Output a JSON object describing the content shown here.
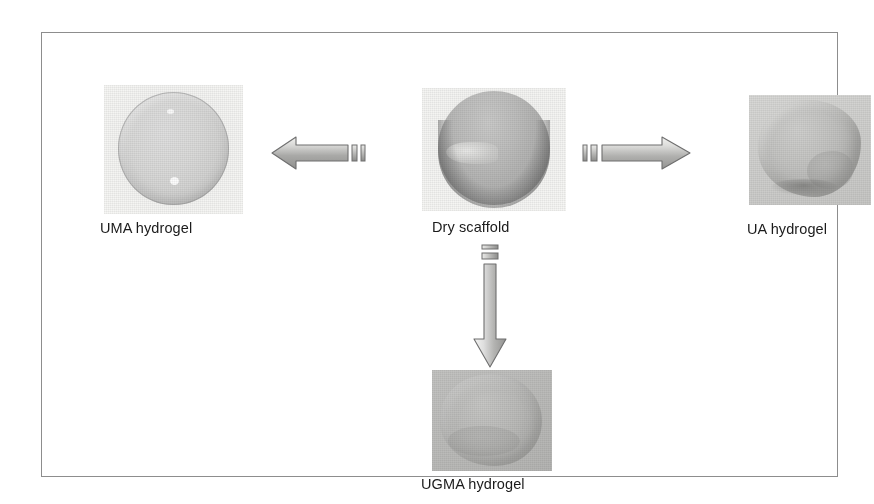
{
  "figure": {
    "frame_color": "#8d8d8d",
    "background": "#ffffff",
    "caption_color": "#1b1b1b",
    "arrow_outline_color": "#6e6e6e",
    "arrow_fill_light": "#e9e9e7",
    "arrow_fill_dark": "#9a9a98"
  },
  "nodes": {
    "uma": {
      "label": "UMA hydrogel",
      "photo_name": "uma-hydrogel-photo",
      "description": "pale translucent round hydrogel disc"
    },
    "dry": {
      "label": "Dry scaffold",
      "photo_name": "dry-scaffold-photo",
      "description": "grey dry circular scaffold with dark crescent shadow"
    },
    "ua": {
      "label": "UA hydrogel",
      "photo_name": "ua-hydrogel-photo",
      "description": "grey irregular lobed swollen hydrogel"
    },
    "ugma": {
      "label": "UGMA hydrogel",
      "photo_name": "ugma-hydrogel-photo",
      "description": "mid-grey textured rounded hydrogel mass"
    }
  },
  "arrows": [
    {
      "name": "arrow-left",
      "direction": "left",
      "from": "Dry scaffold",
      "to": "UMA hydrogel",
      "tail_ticks": 2
    },
    {
      "name": "arrow-right",
      "direction": "right",
      "from": "Dry scaffold",
      "to": "UA hydrogel",
      "tail_ticks": 2
    },
    {
      "name": "arrow-down",
      "direction": "down",
      "from": "Dry scaffold",
      "to": "UGMA hydrogel",
      "tail_ticks": 2
    }
  ]
}
